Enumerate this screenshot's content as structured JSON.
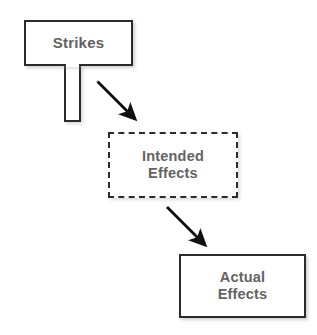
{
  "diagram": {
    "background_color": "#ffffff",
    "nodes": [
      {
        "id": "strikes",
        "label": "Strikes",
        "shape": "sign-post",
        "border_style": "solid",
        "border_color": "#2b2b2b",
        "fill_color": "#ffffff",
        "text_color": "#636363"
      },
      {
        "id": "intended_effects",
        "label": "Intended\nEffects",
        "shape": "rectangle",
        "border_style": "dashed",
        "border_color": "#2b2b2b",
        "fill_color": "#ffffff",
        "text_color": "#636363"
      },
      {
        "id": "actual_effects",
        "label": "Actual\nEffects",
        "shape": "rectangle",
        "border_style": "solid",
        "border_color": "#2b2b2b",
        "fill_color": "#ffffff",
        "text_color": "#636363"
      }
    ],
    "connectors": [
      {
        "id": "strikes_to_intended",
        "from": "strikes",
        "to": "intended_effects",
        "style": "solid-arrow",
        "color": "#111111",
        "label": ""
      },
      {
        "id": "intended_to_actual",
        "from": "intended_effects",
        "to": "actual_effects",
        "style": "solid-arrow",
        "color": "#111111",
        "label": ""
      }
    ]
  }
}
